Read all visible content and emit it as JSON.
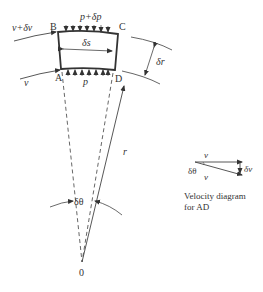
{
  "diagram": {
    "points": {
      "A": "A",
      "B": "B",
      "C": "C",
      "D": "D",
      "origin": "0"
    },
    "labels": {
      "top_pressure": "p+δp",
      "bottom_pressure": "p",
      "outer_velocity": "v+δv",
      "inner_velocity": "v",
      "arc_length": "δs",
      "radial_gap": "δr",
      "radius": "r",
      "angle": "δθ"
    },
    "velocity_diagram": {
      "top_vector": "v",
      "bottom_vector": "v",
      "difference": "δv",
      "angle": "δθ",
      "caption_line1": "Velocity diagram",
      "caption_line2": "for AD"
    }
  }
}
